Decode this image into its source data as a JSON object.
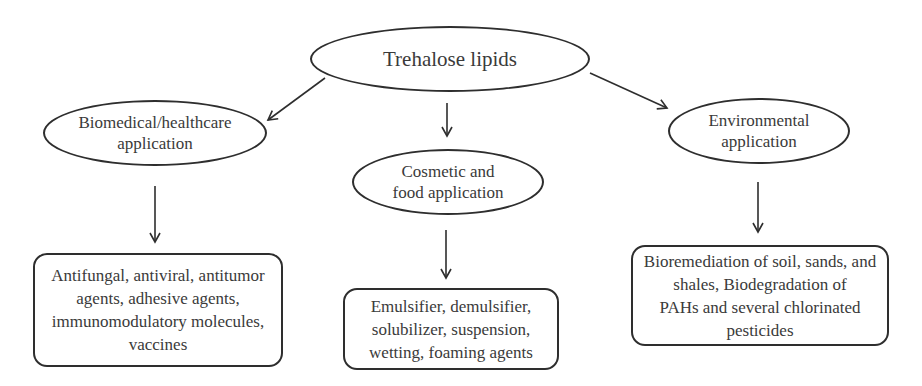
{
  "diagram": {
    "root": {
      "label": "Trehalose lipids"
    },
    "categories": [
      {
        "label_line1": "Biomedical/healthcare",
        "label_line2": "application",
        "details": [
          "Antifungal, antiviral, antitumor",
          "agents, adhesive agents,",
          "immunomodulatory molecules,",
          "vaccines"
        ]
      },
      {
        "label_line1": "Cosmetic and",
        "label_line2": "food application",
        "details": [
          "Emulsifier, demulsifier,",
          "solubilizer, suspension,",
          "wetting, foaming agents"
        ]
      },
      {
        "label_line1": "Environmental",
        "label_line2": "application",
        "details": [
          "Bioremediation of soil, sands, and",
          "shales, Biodegradation of",
          "PAHs and several chlorinated",
          "pesticides"
        ]
      }
    ],
    "colors": {
      "stroke": "#2e2e2e",
      "text": "#3a3a3a",
      "background": "#ffffff"
    }
  }
}
